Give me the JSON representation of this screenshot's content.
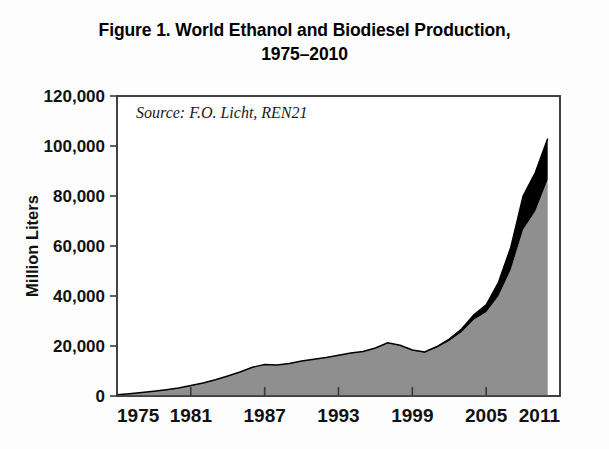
{
  "figure": {
    "title_line_1": "Figure 1. World Ethanol and Biodiesel Production,",
    "title_line_2": "1975–2010",
    "source_note": "Source: F.O. Licht, REN21"
  },
  "colors": {
    "ethanol_fill": "#8f8f8f",
    "biodiesel_fill": "#000000",
    "plot_background": "#ffffff",
    "axis": "#3a3a3a",
    "page_background": "#fdfdfd",
    "text": "#111111"
  },
  "chart_data": {
    "type": "area",
    "stacked": true,
    "title": "Figure 1. World Ethanol and Biodiesel Production, 1975–2010",
    "subtitle": "1975–2010",
    "xlabel": "",
    "ylabel": "Million Liters",
    "xlim": [
      1975,
      2011
    ],
    "ylim": [
      0,
      120000
    ],
    "ytick_labels": [
      "0",
      "20,000",
      "40,000",
      "60,000",
      "80,000",
      "100,000",
      "120,000"
    ],
    "yticks": [
      0,
      20000,
      40000,
      60000,
      80000,
      100000,
      120000
    ],
    "xtick_labels": [
      "1975",
      "1981",
      "1987",
      "1993",
      "1999",
      "2005",
      "2011"
    ],
    "xticks": [
      1975,
      1981,
      1987,
      1993,
      1999,
      2005,
      2011
    ],
    "grid": false,
    "legend": "none",
    "annotations": [
      "Source: F.O. Licht, REN21"
    ],
    "x": [
      1975,
      1976,
      1977,
      1978,
      1979,
      1980,
      1981,
      1982,
      1983,
      1984,
      1985,
      1986,
      1987,
      1988,
      1989,
      1990,
      1991,
      1992,
      1993,
      1994,
      1995,
      1996,
      1997,
      1998,
      1999,
      2000,
      2001,
      2002,
      2003,
      2004,
      2005,
      2006,
      2007,
      2008,
      2009,
      2010
    ],
    "series": [
      {
        "name": "Ethanol",
        "color": "#8f8f8f",
        "values": [
          500,
          900,
          1400,
          1900,
          2500,
          3200,
          4200,
          5200,
          6500,
          8000,
          9600,
          11500,
          12600,
          12400,
          13000,
          14000,
          14700,
          15400,
          16300,
          17200,
          17800,
          19200,
          21300,
          20200,
          18200,
          17300,
          19300,
          22000,
          25500,
          30500,
          33500,
          40000,
          50500,
          66500,
          74000,
          86500
        ]
      },
      {
        "name": "Biodiesel",
        "color": "#000000",
        "values": [
          0,
          0,
          0,
          0,
          0,
          0,
          0,
          0,
          0,
          0,
          0,
          0,
          0,
          0,
          0,
          0,
          0,
          0,
          0,
          0,
          0,
          0,
          0,
          100,
          200,
          300,
          500,
          800,
          1300,
          2000,
          3000,
          5500,
          9000,
          13500,
          15500,
          16500
        ]
      }
    ],
    "totals_note": "Top of stacked area reaches approximately 103,000 million liters in 2010"
  }
}
